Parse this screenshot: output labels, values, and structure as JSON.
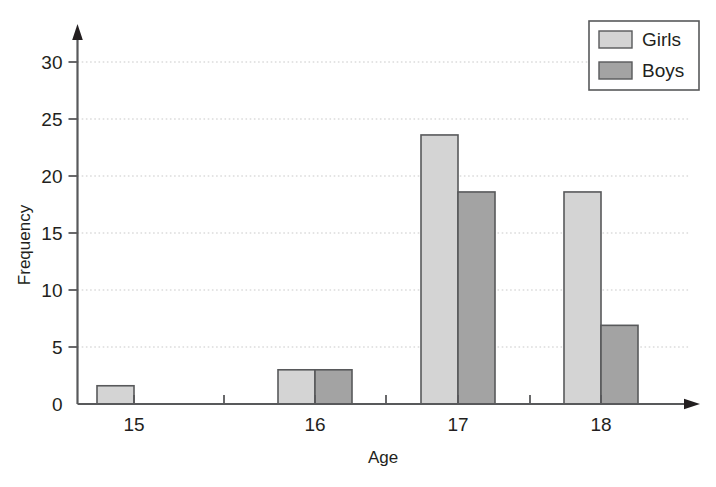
{
  "chart_data": {
    "type": "bar",
    "title": "",
    "xlabel": "Age",
    "ylabel": "Frequency",
    "categories": [
      "15",
      "16",
      "17",
      "18"
    ],
    "series": [
      {
        "name": "Girls",
        "values": [
          1.6,
          3,
          23.6,
          18.6
        ],
        "color": "#d4d4d4"
      },
      {
        "name": "Boys",
        "values": [
          0,
          3,
          18.6,
          6.9
        ],
        "color": "#a3a3a3"
      }
    ],
    "ylim": [
      0,
      32
    ],
    "yticks": [
      0,
      5,
      10,
      15,
      20,
      25,
      30
    ],
    "ytick_labels": [
      "0",
      "5",
      "10",
      "15",
      "20",
      "25",
      "30"
    ],
    "xtick_labels": [
      "15",
      "16",
      "17",
      "18"
    ],
    "grid": true,
    "grid_axis": "y",
    "grid_style": "dotted",
    "legend_position": "top-right",
    "legend_entries": [
      "Girls",
      "Boys"
    ]
  },
  "axes": {
    "x_title": "Age",
    "y_title": "Frequency"
  },
  "colors": {
    "girls_fill": "#d4d4d4",
    "boys_fill": "#a3a3a3",
    "bar_stroke": "#58595b",
    "axis": "#58595b",
    "grid": "#c9c9c9",
    "text": "#231f20",
    "legend_border": "#58595b",
    "background": "#ffffff"
  },
  "legend": {
    "items": [
      {
        "label": "Girls",
        "swatch": "girls-swatch"
      },
      {
        "label": "Boys",
        "swatch": "boys-swatch"
      }
    ]
  }
}
